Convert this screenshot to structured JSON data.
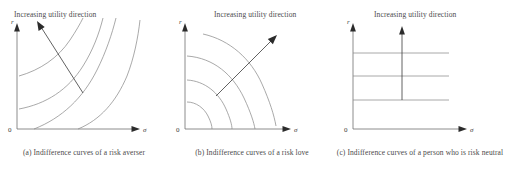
{
  "figure": {
    "panels": [
      {
        "id": "a",
        "util_label": "Increasing utility direction",
        "caption": "(a) Indifference curves of a risk averser",
        "y_axis_label": "r",
        "x_axis_label": "σ",
        "origin_label": "0",
        "curve_type": "convex",
        "curve_count": 4,
        "arrow_direction": "up-left"
      },
      {
        "id": "b",
        "util_label": "Increasing utility direction",
        "caption": "(b) Indifference curves of a risk love",
        "y_axis_label": "r",
        "x_axis_label": "σ",
        "origin_label": "0",
        "curve_type": "concave",
        "curve_count": 4,
        "arrow_direction": "up-right"
      },
      {
        "id": "c",
        "util_label": "Increasing utility direction",
        "caption": "(c) Indifference curves of a person who is risk neutral",
        "y_axis_label": "r",
        "x_axis_label": "σ",
        "origin_label": "0",
        "curve_type": "horizontal",
        "curve_count": 3,
        "arrow_direction": "up"
      }
    ],
    "colors": {
      "curve": "#8c8c8c",
      "axis": "#6f6f6f",
      "arrow": "#2b2b2b",
      "text": "#4a4a4a",
      "background": "#ffffff"
    }
  }
}
